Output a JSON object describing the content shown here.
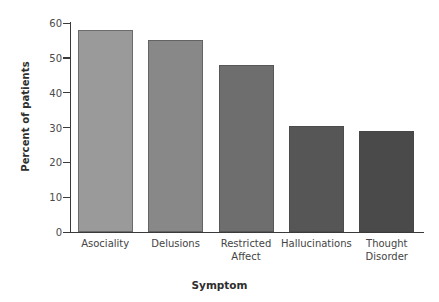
{
  "chart_data": {
    "type": "bar",
    "title": "",
    "xlabel": "Symptom",
    "ylabel": "Percent of patients",
    "categories": [
      "Asociality",
      "Restricted\nAffect",
      "Delusions",
      "Hallucinations",
      "Thought\nDisorder"
    ],
    "category_lines": [
      [
        "Asociality"
      ],
      [
        "Delusions"
      ],
      [
        "Restricted",
        "Affect"
      ],
      [
        "Hallucinations"
      ],
      [
        "Thought",
        "Disorder"
      ]
    ],
    "values": [
      58,
      55,
      48,
      30.5,
      29
    ],
    "bar_colors": [
      "#9a9a9a",
      "#888888",
      "#6e6e6e",
      "#565656",
      "#4a4a4a"
    ],
    "ylim": [
      0,
      60
    ],
    "yticks": [
      0,
      10,
      20,
      30,
      40,
      50,
      60
    ],
    "ytick_labels": [
      "0",
      "10",
      "20",
      "30",
      "40",
      "50",
      "60"
    ],
    "grid": false,
    "legend": "none",
    "axis_color": "#3a3a3a"
  },
  "axes": {
    "x_title": "Symptom",
    "y_title": "Percent of patients"
  }
}
